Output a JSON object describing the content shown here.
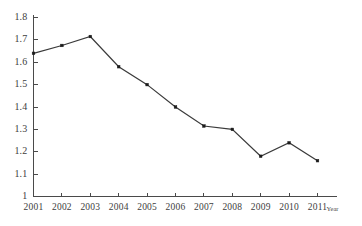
{
  "chart_data": {
    "type": "line",
    "title": "",
    "xlabel": "Year",
    "ylabel": "",
    "categories": [
      "2001",
      "2002",
      "2003",
      "2004",
      "2005",
      "2006",
      "2007",
      "2008",
      "2009",
      "2010",
      "2011"
    ],
    "values": [
      1.64,
      1.675,
      1.715,
      1.58,
      1.5,
      1.4,
      1.315,
      1.3,
      1.18,
      1.24,
      1.16
    ],
    "series": [
      {
        "name": "",
        "values": [
          1.64,
          1.675,
          1.715,
          1.58,
          1.5,
          1.4,
          1.315,
          1.3,
          1.18,
          1.24,
          1.16
        ]
      }
    ],
    "ylim": [
      1.0,
      1.8
    ],
    "ytick_labels": [
      "1.8",
      "1.7",
      "1.6",
      "1.5",
      "1.4",
      "1.3",
      "1.2",
      "1.1",
      "1"
    ],
    "ytick_values": [
      1.8,
      1.7,
      1.6,
      1.5,
      1.4,
      1.3,
      1.2,
      1.1,
      1.0
    ],
    "xtick_labels": [
      "2001",
      "2002",
      "2003",
      "2004",
      "2005",
      "2006",
      "2007",
      "2008",
      "2009",
      "2010",
      "2011"
    ],
    "grid": false,
    "legend": "none",
    "marker": "square",
    "line_color": "#3a3a3a",
    "marker_color": "#1c1c1c",
    "axis_color": "#4a4a4a",
    "background_color": "#ffffff"
  }
}
